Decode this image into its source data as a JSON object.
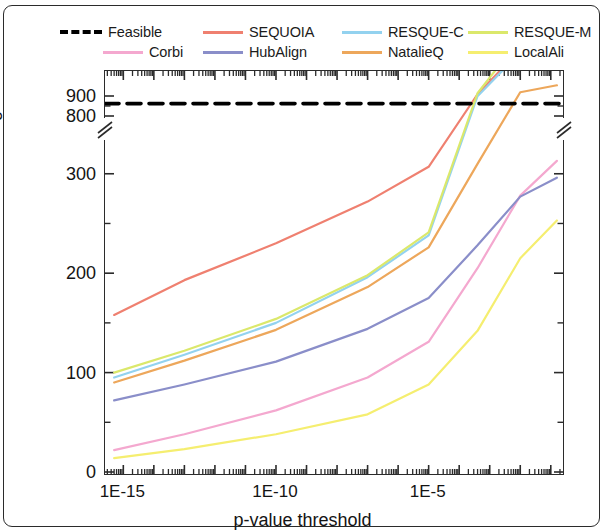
{
  "chart_data": {
    "type": "line",
    "title": "",
    "xlabel": "p-value threshold",
    "ylabel": "Number of significant hits",
    "x_scale": "log",
    "x_tick_labels": [
      "1E-15",
      "1E-10",
      "1E-5"
    ],
    "x_tick_values": [
      -15,
      -10,
      -5
    ],
    "xlim": [
      -15.6,
      -0.6
    ],
    "y_tick_labels": [
      "0",
      "100",
      "200",
      "300",
      "800",
      "900"
    ],
    "y_tick_values": [
      0,
      100,
      200,
      300,
      800,
      900
    ],
    "ylim_lower": [
      0,
      340
    ],
    "ylim_upper": [
      780,
      930
    ],
    "axis_break": true,
    "axis_break_note": "y-axis broken between 340 and 780",
    "grid": false,
    "legend_position": "above-plot",
    "series": [
      {
        "name": "Feasible",
        "color": "#000000",
        "style": "dash-dot",
        "constant": true,
        "x": [
          -15.6,
          -0.6
        ],
        "values": [
          862,
          862
        ]
      },
      {
        "name": "SEQUOIA",
        "color": "#ef8070",
        "style": "solid",
        "x": [
          -15.3,
          -13.0,
          -10.0,
          -7.0,
          -5.0,
          -3.4,
          -2.0,
          -0.8
        ],
        "values": [
          158,
          193,
          230,
          272,
          307,
          380,
          425,
          432
        ]
      },
      {
        "name": "RESQUE-C",
        "color": "#93d2ef",
        "style": "solid",
        "x": [
          -15.3,
          -13.0,
          -10.0,
          -7.0,
          -5.0,
          -3.4,
          -2.0,
          -0.8
        ],
        "values": [
          95,
          118,
          150,
          196,
          238,
          378,
          422,
          440
        ]
      },
      {
        "name": "RESQUE-M",
        "color": "#dbe86b",
        "style": "solid",
        "x": [
          -15.3,
          -13.0,
          -10.0,
          -7.0,
          -5.0,
          -3.4,
          -2.0,
          -0.8
        ],
        "values": [
          100,
          122,
          154,
          198,
          241,
          381,
          436,
          458
        ]
      },
      {
        "name": "Corbi",
        "color": "#f4a8cf",
        "style": "solid",
        "x": [
          -15.3,
          -13.0,
          -10.0,
          -7.0,
          -5.0,
          -3.4,
          -2.0,
          -0.8
        ],
        "values": [
          22,
          38,
          62,
          95,
          131,
          205,
          278,
          313
        ]
      },
      {
        "name": "HubAlign",
        "color": "#8a8ec9",
        "style": "solid",
        "x": [
          -15.3,
          -13.0,
          -10.0,
          -7.0,
          -5.0,
          -3.4,
          -2.0,
          -0.8
        ],
        "values": [
          72,
          88,
          111,
          144,
          175,
          228,
          277,
          296
        ]
      },
      {
        "name": "NatalieQ",
        "color": "#eda75b",
        "style": "solid",
        "x": [
          -15.3,
          -13.0,
          -10.0,
          -7.0,
          -5.0,
          -3.4,
          -2.0,
          -0.8
        ],
        "values": [
          90,
          112,
          143,
          186,
          226,
          310,
          382,
          389
        ]
      },
      {
        "name": "LocalAli",
        "color": "#f5ee70",
        "style": "solid",
        "x": [
          -15.3,
          -13.0,
          -10.0,
          -7.0,
          -5.0,
          -3.4,
          -2.0,
          -0.8
        ],
        "values": [
          14,
          23,
          38,
          58,
          88,
          142,
          215,
          253
        ]
      }
    ]
  },
  "legend": {
    "row1": [
      {
        "label": "Feasible",
        "color": "#000000",
        "style": "dash-dot"
      },
      {
        "label": "SEQUOIA",
        "color": "#ef8070",
        "style": "solid"
      },
      {
        "label": "RESQUE-C",
        "color": "#93d2ef",
        "style": "solid"
      },
      {
        "label": "RESQUE-M",
        "color": "#dbe86b",
        "style": "solid"
      }
    ],
    "row2": [
      {
        "label": "Corbi",
        "color": "#f4a8cf",
        "style": "solid"
      },
      {
        "label": "HubAlign",
        "color": "#8a8ec9",
        "style": "solid"
      },
      {
        "label": "NatalieQ",
        "color": "#eda75b",
        "style": "solid"
      },
      {
        "label": "LocalAli",
        "color": "#f5ee70",
        "style": "solid"
      }
    ]
  },
  "axes": {
    "x_label": "p-value threshold",
    "y_label": "Number of significant hits",
    "x_ticks": [
      "1E-15",
      "1E-10",
      "1E-5"
    ],
    "y_ticks": [
      "900",
      "800",
      "300",
      "200",
      "100",
      "0"
    ]
  }
}
